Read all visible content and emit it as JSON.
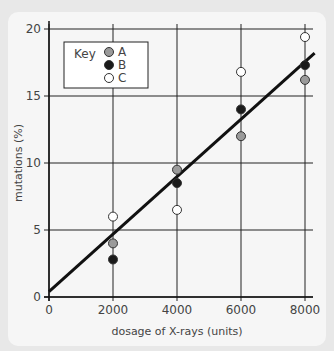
{
  "chart_data": {
    "type": "scatter",
    "title": "",
    "xlabel": "dosage of X-rays (units)",
    "ylabel": "mutations (%)",
    "xlim": [
      0,
      8000
    ],
    "ylim": [
      0,
      20
    ],
    "x_ticks": [
      "0",
      "2000",
      "4000",
      "6000",
      "8000"
    ],
    "y_ticks": [
      "0",
      "5",
      "10",
      "15",
      "20"
    ],
    "grid": true,
    "legend": {
      "title": "Key",
      "position": "top-left",
      "entries": [
        "A",
        "B",
        "C"
      ]
    },
    "x": [
      2000,
      4000,
      6000,
      8000
    ],
    "series": [
      {
        "name": "A",
        "color": "#9a9a9a",
        "values": [
          4.0,
          9.5,
          12.0,
          16.2
        ]
      },
      {
        "name": "B",
        "color": "#1a1a1a",
        "values": [
          2.8,
          8.5,
          14.0,
          17.3
        ]
      },
      {
        "name": "C",
        "color": "#ffffff",
        "values": [
          6.0,
          6.5,
          16.8,
          19.4
        ]
      }
    ],
    "trend_line": {
      "x": [
        0,
        8300
      ],
      "y": [
        0.4,
        18.2
      ]
    }
  }
}
